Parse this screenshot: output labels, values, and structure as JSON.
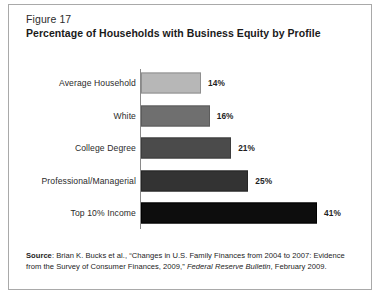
{
  "figure": {
    "number": "Figure 17",
    "title": "Percentage of Households with Business Equity by Profile"
  },
  "chart_data": {
    "type": "bar",
    "orientation": "horizontal",
    "title": "Percentage of Households with Business Equity by Profile",
    "xlabel": "",
    "ylabel": "",
    "xlim": [
      0,
      41
    ],
    "grid": false,
    "legend": "none",
    "categories": [
      "Average Household",
      "White",
      "College Degree",
      "Professional/Managerial",
      "Top 10% Income"
    ],
    "values": [
      14,
      16,
      21,
      25,
      41
    ],
    "value_labels": [
      "14%",
      "16%",
      "21%",
      "25%",
      "41%"
    ],
    "bar_colors": [
      "#b7b7b7",
      "#6f6f6f",
      "#4b4b4b",
      "#333333",
      "#0d0d0d"
    ],
    "bar_border_colors": [
      "#8f8f8f",
      "#5c5c5c",
      "#3d3d3d",
      "#262626",
      "#000000"
    ]
  },
  "source": {
    "label": "Source",
    "text_part1": ": Brian K. Bucks et al., “Changes in U.S. Family Finances from 2004 to 2007:  Evidence from the Survey of Consumer Finances, 2009,” ",
    "italic": "Federal Reserve Bulletin",
    "text_part2": ", February 2009."
  },
  "colors": {
    "frame_border": "#a9a9a9",
    "axis_line": "#8a8a8a",
    "text": "#231f20",
    "background": "#ffffff"
  }
}
